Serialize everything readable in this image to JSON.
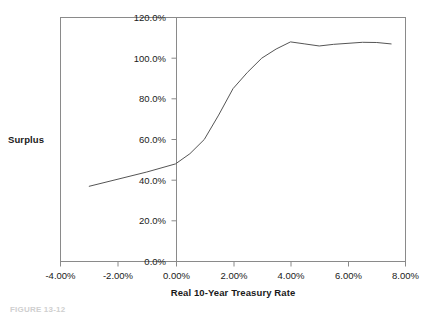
{
  "chart_data": {
    "type": "line",
    "title": "",
    "xlabel": "Real 10-Year Treasury Rate",
    "ylabel": "Surplus",
    "xlim": [
      -4.0,
      8.0
    ],
    "ylim": [
      0.0,
      120.0
    ],
    "grid": false,
    "legend": "none",
    "xticks": [
      -4.0,
      -2.0,
      0.0,
      2.0,
      4.0,
      6.0,
      8.0
    ],
    "xticklabels": [
      "-4.00%",
      "-2.00%",
      "0.00%",
      "2.00%",
      "4.00%",
      "6.00%",
      "8.00%"
    ],
    "yticks": [
      0.0,
      20.0,
      40.0,
      60.0,
      80.0,
      100.0,
      120.0
    ],
    "yticklabels": [
      "0.0%",
      "20.0%",
      "40.0%",
      "60.0%",
      "80.0%",
      "100.0%",
      "120.0%"
    ],
    "series": [
      {
        "name": "Surplus",
        "x": [
          -3.0,
          -2.0,
          -1.0,
          0.0,
          0.5,
          1.0,
          1.5,
          2.0,
          2.5,
          3.0,
          3.5,
          4.0,
          4.5,
          5.0,
          5.5,
          6.0,
          6.5,
          7.0,
          7.5
        ],
        "values": [
          37.0,
          40.5,
          44.0,
          48.0,
          53.0,
          60.0,
          72.0,
          85.0,
          93.0,
          100.0,
          104.5,
          108.0,
          107.0,
          106.0,
          106.8,
          107.3,
          107.8,
          107.7,
          107.0
        ]
      }
    ],
    "line_color": "#555555",
    "axis_color": "#8a8a8a",
    "text_color": "#1a1a1a"
  },
  "axis_titles": {
    "y": "Surplus",
    "x": "Real 10-Year Treasury Rate"
  },
  "caption": {
    "text": "FIGURE 13-12"
  }
}
